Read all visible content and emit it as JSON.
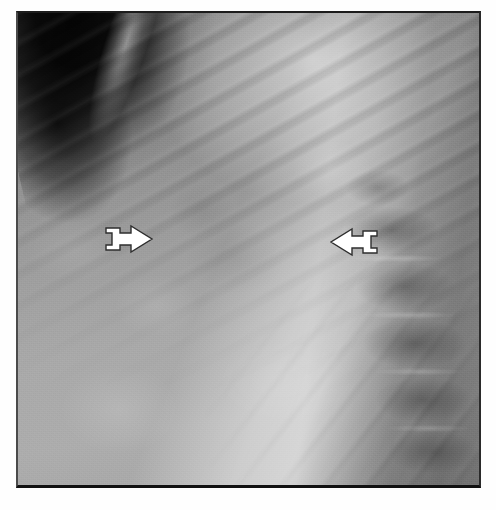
{
  "document": {
    "type": "radiographic-image",
    "modality": "x-ray",
    "view": "lateral chest radiograph",
    "caption": "",
    "background_color": "#ffffff"
  },
  "radiograph": {
    "frame": {
      "x": 16,
      "y": 11,
      "width": 465,
      "height": 477,
      "border_color": "#1c1c1c"
    },
    "tones": {
      "air_dark": "#0a0a0a",
      "soft_tissue_mid": "#8e8e8e",
      "bright_band": "#e8e8e8",
      "base_gray": "#a2a2a2",
      "spine_dark": "#6a6a6a"
    },
    "regions": [
      {
        "name": "air-pocket-upper-left",
        "tone": "dark"
      },
      {
        "name": "rib-striations-upper",
        "tone": "mid"
      },
      {
        "name": "bright-diagonal-band-upper-right",
        "tone": "bright"
      },
      {
        "name": "soft-tissue-center",
        "tone": "mid"
      },
      {
        "name": "vertebral-bodies-right",
        "tone": "dark-mottled"
      },
      {
        "name": "soft-tissue-lower-left",
        "tone": "light"
      }
    ]
  },
  "annotations": {
    "markers": [
      {
        "id": "arrow-left",
        "label": "left annotation arrow",
        "direction": "right",
        "color": "#ffffff",
        "outline_color": "#2e2e2e",
        "x": 93,
        "y": 213
      },
      {
        "id": "arrow-right",
        "label": "right annotation arrow",
        "direction": "left",
        "color": "#ffffff",
        "outline_color": "#2e2e2e",
        "x": 322,
        "y": 215
      }
    ]
  }
}
